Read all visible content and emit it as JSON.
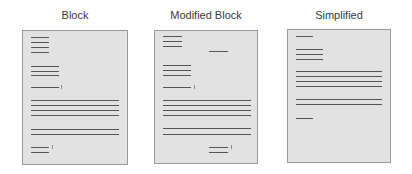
{
  "figure": {
    "panels": [
      {
        "id": "block",
        "title": "Block",
        "title_x": 75,
        "page": {
          "left": 22,
          "top": 30,
          "width": 106,
          "height": 135
        },
        "lines": [
          {
            "x": 31,
            "y": 37,
            "w": 18
          },
          {
            "x": 31,
            "y": 42,
            "w": 18
          },
          {
            "x": 31,
            "y": 47,
            "w": 18
          },
          {
            "x": 31,
            "y": 52,
            "w": 18
          },
          {
            "x": 31,
            "y": 66,
            "w": 28
          },
          {
            "x": 31,
            "y": 71,
            "w": 28
          },
          {
            "x": 31,
            "y": 75,
            "w": 28
          },
          {
            "x": 31,
            "y": 87,
            "w": 28
          },
          {
            "x": 31,
            "y": 100,
            "w": 88
          },
          {
            "x": 31,
            "y": 105,
            "w": 88
          },
          {
            "x": 31,
            "y": 110,
            "w": 88
          },
          {
            "x": 31,
            "y": 115,
            "w": 88
          },
          {
            "x": 31,
            "y": 129,
            "w": 88
          },
          {
            "x": 31,
            "y": 134,
            "w": 88
          },
          {
            "x": 31,
            "y": 147,
            "w": 18
          },
          {
            "x": 31,
            "y": 152,
            "w": 18
          }
        ],
        "marks": [
          {
            "x": 61,
            "y": 85
          },
          {
            "x": 52,
            "y": 145
          }
        ]
      },
      {
        "id": "modified-block",
        "title": "Modified Block",
        "title_x": 206,
        "page": {
          "left": 154,
          "top": 30,
          "width": 104,
          "height": 134
        },
        "lines": [
          {
            "x": 163,
            "y": 36,
            "w": 19
          },
          {
            "x": 163,
            "y": 41,
            "w": 19
          },
          {
            "x": 163,
            "y": 46,
            "w": 19
          },
          {
            "x": 209,
            "y": 51,
            "w": 19
          },
          {
            "x": 163,
            "y": 65,
            "w": 28
          },
          {
            "x": 163,
            "y": 70,
            "w": 28
          },
          {
            "x": 163,
            "y": 75,
            "w": 28
          },
          {
            "x": 163,
            "y": 87,
            "w": 28
          },
          {
            "x": 163,
            "y": 100,
            "w": 88
          },
          {
            "x": 163,
            "y": 105,
            "w": 88
          },
          {
            "x": 163,
            "y": 110,
            "w": 88
          },
          {
            "x": 163,
            "y": 115,
            "w": 88
          },
          {
            "x": 163,
            "y": 128,
            "w": 88
          },
          {
            "x": 163,
            "y": 134,
            "w": 88
          },
          {
            "x": 209,
            "y": 147,
            "w": 19
          },
          {
            "x": 209,
            "y": 152,
            "w": 19
          }
        ],
        "marks": [
          {
            "x": 194,
            "y": 85
          },
          {
            "x": 231,
            "y": 145
          }
        ]
      },
      {
        "id": "simplified",
        "title": "Simplified",
        "title_x": 339,
        "page": {
          "left": 287,
          "top": 29,
          "width": 104,
          "height": 134
        },
        "lines": [
          {
            "x": 296,
            "y": 36,
            "w": 17
          },
          {
            "x": 296,
            "y": 49,
            "w": 27
          },
          {
            "x": 296,
            "y": 54,
            "w": 27
          },
          {
            "x": 296,
            "y": 59,
            "w": 27
          },
          {
            "x": 296,
            "y": 71,
            "w": 86
          },
          {
            "x": 296,
            "y": 76,
            "w": 86
          },
          {
            "x": 296,
            "y": 81,
            "w": 86
          },
          {
            "x": 296,
            "y": 86,
            "w": 86
          },
          {
            "x": 296,
            "y": 99,
            "w": 86
          },
          {
            "x": 296,
            "y": 104,
            "w": 86
          },
          {
            "x": 296,
            "y": 118,
            "w": 17
          }
        ],
        "marks": []
      }
    ],
    "colors": {
      "page_fill": "#e2e2e2",
      "page_border": "#9a9a9a",
      "line": "#555555",
      "title_text": "#3a3a3a"
    }
  }
}
